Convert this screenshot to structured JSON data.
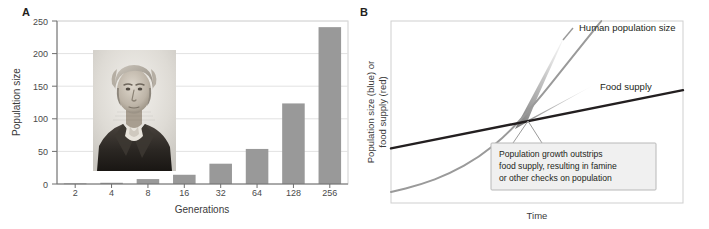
{
  "figure": {
    "panel_a": {
      "letter": "A",
      "portrait_alt": "portrait-of-thomas-malthus"
    },
    "panel_b": {
      "letter": "B"
    }
  },
  "chart_data": [
    {
      "type": "bar",
      "panel": "A",
      "title": "",
      "xlabel": "Generations",
      "ylabel": "Population size",
      "categories": [
        "2",
        "4",
        "8",
        "16",
        "32",
        "64",
        "128",
        "256"
      ],
      "values": [
        1,
        2,
        8,
        15,
        33,
        57,
        131,
        255
      ],
      "ylim": [
        0,
        265
      ],
      "yticks": [
        0,
        50,
        100,
        150,
        200,
        250
      ],
      "ytick_labels": [
        "0",
        "50",
        "100",
        "150",
        "200",
        "250"
      ],
      "grid": true,
      "legend": "none",
      "bar_color": "#999999"
    },
    {
      "type": "line",
      "panel": "B",
      "title": "",
      "xlabel": "Time",
      "ylabel_line1": "Population size (blue) or",
      "ylabel_line2": "food supply (red)",
      "xlim": [
        0,
        1
      ],
      "ylim": [
        0,
        1
      ],
      "grid": false,
      "legend": "inline-labels",
      "series": [
        {
          "name": "Human population size",
          "shape": "exponential",
          "color": "#9a9a9a",
          "label": "Human population size",
          "x": [
            0.0,
            0.1,
            0.2,
            0.3,
            0.4,
            0.5,
            0.58,
            0.66,
            0.72
          ],
          "y": [
            0.06,
            0.1,
            0.16,
            0.25,
            0.38,
            0.56,
            0.72,
            0.88,
            1.0
          ]
        },
        {
          "name": "Food supply",
          "shape": "linear",
          "color": "#231f20",
          "label": "Food supply",
          "x": [
            0.0,
            1.0
          ],
          "y": [
            0.3,
            0.62
          ]
        }
      ],
      "annotations": [
        {
          "name": "famine-callout",
          "lines": [
            "Population growth outstrips",
            "food supply, resulting in famine",
            "or other checks on population"
          ],
          "box_fill": "#f0f0f0",
          "box_border": "#b8b8b8"
        }
      ],
      "shaded_gap": {
        "name": "gap-between-population-and-food",
        "description": "gradient wedge between exponential curve and food supply line after crossover"
      }
    }
  ]
}
